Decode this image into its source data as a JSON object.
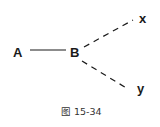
{
  "diagram": {
    "nodes": [
      {
        "id": "A",
        "label": "A"
      },
      {
        "id": "B",
        "label": "B"
      },
      {
        "id": "x",
        "label": "x"
      },
      {
        "id": "y",
        "label": "y"
      }
    ],
    "edges": [
      {
        "from": "A",
        "to": "B",
        "style": "solid"
      },
      {
        "from": "B",
        "to": "x",
        "style": "dashed"
      },
      {
        "from": "B",
        "to": "y",
        "style": "dashed"
      }
    ],
    "caption": "图 15-34"
  }
}
